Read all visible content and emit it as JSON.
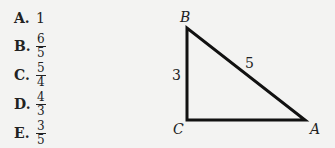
{
  "answer_choices": [
    {
      "letter": "A.",
      "value": "1",
      "fraction": null
    },
    {
      "letter": "B.",
      "value": null,
      "fraction": {
        "num": "6",
        "den": "5"
      }
    },
    {
      "letter": "C.",
      "value": null,
      "fraction": {
        "num": "5",
        "den": "4"
      }
    },
    {
      "letter": "D.",
      "value": null,
      "fraction": {
        "num": "4",
        "den": "3"
      }
    },
    {
      "letter": "E.",
      "value": null,
      "fraction": {
        "num": "3",
        "den": "5"
      }
    }
  ],
  "diagram": {
    "shape": "right-triangle",
    "vertices": {
      "top": "B",
      "right_angle": "C",
      "right": "A"
    },
    "side_labels": {
      "BC": "3",
      "AB": "5"
    },
    "stroke_color": "#111111"
  }
}
